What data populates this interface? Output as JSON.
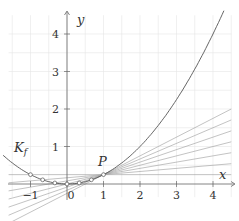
{
  "figure": {
    "function_label": "K_f",
    "function": "x^2/4",
    "point_label": "P",
    "point": [
      1,
      0.25
    ],
    "x_axis_label": "x",
    "y_axis_label": "y",
    "x_ticks": [
      "−1",
      "0",
      "1",
      "2",
      "3",
      "4"
    ],
    "x_tick_values": [
      -1,
      0,
      1,
      2,
      3,
      4
    ],
    "y_ticks": [
      "1",
      "2",
      "3",
      "4"
    ],
    "y_tick_values": [
      1,
      2,
      3,
      4
    ],
    "secant_base_points_x": [
      -1,
      -0.6667,
      -0.3333,
      0,
      0.3333,
      0.6667
    ],
    "tangent_at_x": 1,
    "colors": {
      "curve": "#555555",
      "secant": "#9a9a9a",
      "axis": "#666666",
      "grid": "#e6e6e6",
      "marker_fill": "#ffffff",
      "marker_stroke": "#555555"
    }
  }
}
